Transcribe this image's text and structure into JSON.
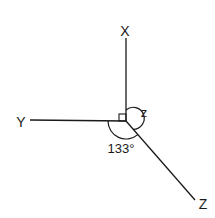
{
  "diagram": {
    "type": "geometry-angles",
    "center": {
      "x": 126,
      "y": 121
    },
    "line_color": "#1a1a1a",
    "axes": [
      {
        "label": "X",
        "end": {
          "x": 126,
          "y": 38
        },
        "label_pos": {
          "x": 125,
          "y": 36
        }
      },
      {
        "label": "Y",
        "end": {
          "x": 30,
          "y": 121
        },
        "label_pos": {
          "x": 21,
          "y": 127
        }
      },
      {
        "label": "Z",
        "end": {
          "x": 195,
          "y": 200
        },
        "label_pos": {
          "x": 203,
          "y": 209
        }
      }
    ],
    "angles": [
      {
        "name": "right-angle",
        "between": [
          "X",
          "Y"
        ],
        "marker": "square",
        "label": ""
      },
      {
        "name": "angle-z",
        "between": [
          "X",
          "Z"
        ],
        "label": "z"
      },
      {
        "name": "angle-133",
        "between": [
          "Y",
          "Z"
        ],
        "label": "133°"
      }
    ]
  }
}
